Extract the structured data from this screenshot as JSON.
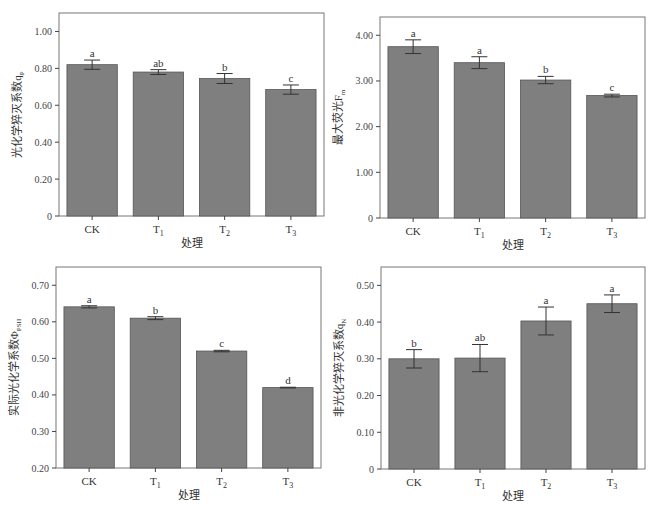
{
  "figure": {
    "caption": "",
    "bar_color": "#7f7f7f",
    "bar_edge": "#555555",
    "frame_color": "#777777"
  },
  "chart_data": [
    {
      "type": "bar",
      "title": "",
      "xlabel": "处理",
      "ylabel": "光化学猝灭系数qP",
      "ylabel_main": "光化学猝灭系数q",
      "ylabel_sub": "P",
      "categories": [
        "CK",
        "T1",
        "T2",
        "T3"
      ],
      "category_labels": [
        {
          "main": "CK",
          "sub": ""
        },
        {
          "main": "T",
          "sub": "1"
        },
        {
          "main": "T",
          "sub": "2"
        },
        {
          "main": "T",
          "sub": "3"
        }
      ],
      "values": [
        0.82,
        0.78,
        0.745,
        0.685
      ],
      "errors": [
        0.025,
        0.013,
        0.027,
        0.025
      ],
      "significance": [
        "a",
        "ab",
        "b",
        "c"
      ],
      "yticks": [
        0,
        0.2,
        0.4,
        0.6,
        0.8,
        1.0
      ],
      "ytick_labels": [
        "0",
        "0.20",
        "0.40",
        "0.60",
        "0.80",
        "1.00"
      ],
      "ylim": [
        0,
        1.1
      ],
      "grid": false,
      "legend": null
    },
    {
      "type": "bar",
      "title": "",
      "xlabel": "处理",
      "ylabel": "最大荧光Fm",
      "ylabel_main": "最大荧光F",
      "ylabel_sub": "m",
      "categories": [
        "CK",
        "T1",
        "T2",
        "T3"
      ],
      "category_labels": [
        {
          "main": "CK",
          "sub": ""
        },
        {
          "main": "T",
          "sub": "1"
        },
        {
          "main": "T",
          "sub": "2"
        },
        {
          "main": "T",
          "sub": "3"
        }
      ],
      "values": [
        3.75,
        3.4,
        3.02,
        2.68
      ],
      "errors": [
        0.15,
        0.13,
        0.08,
        0.03
      ],
      "significance": [
        "a",
        "a",
        "b",
        "c"
      ],
      "yticks": [
        0,
        1,
        2,
        3,
        4
      ],
      "ytick_labels": [
        "0",
        "1.00",
        "2.00",
        "3.00",
        "4.00"
      ],
      "ylim": [
        0,
        4.4
      ],
      "grid": false,
      "legend": null
    },
    {
      "type": "bar",
      "title": "",
      "xlabel": "处理",
      "ylabel": "实际光化学系数ΦPSII",
      "ylabel_main": "实际光化学系数Φ",
      "ylabel_sub": "PSII",
      "categories": [
        "CK",
        "T1",
        "T2",
        "T3"
      ],
      "category_labels": [
        {
          "main": "CK",
          "sub": ""
        },
        {
          "main": "T",
          "sub": "1"
        },
        {
          "main": "T",
          "sub": "2"
        },
        {
          "main": "T",
          "sub": "3"
        }
      ],
      "values": [
        0.641,
        0.61,
        0.52,
        0.42
      ],
      "errors": [
        0.003,
        0.004,
        0.002,
        0.001
      ],
      "significance": [
        "a",
        "b",
        "c",
        "d"
      ],
      "yticks": [
        0.2,
        0.3,
        0.4,
        0.5,
        0.6,
        0.7
      ],
      "ytick_labels": [
        "0.20",
        "0.30",
        "0.40",
        "0.50",
        "0.60",
        "0.70"
      ],
      "ylim": [
        0.2,
        0.75
      ],
      "grid": false,
      "legend": null
    },
    {
      "type": "bar",
      "title": "",
      "xlabel": "处理",
      "ylabel": "非光化学猝灭系数qN",
      "ylabel_main": "非光化学猝灭系数q",
      "ylabel_sub": "N",
      "categories": [
        "CK",
        "T1",
        "T2",
        "T3"
      ],
      "category_labels": [
        {
          "main": "CK",
          "sub": ""
        },
        {
          "main": "T",
          "sub": "1"
        },
        {
          "main": "T",
          "sub": "2"
        },
        {
          "main": "T",
          "sub": "3"
        }
      ],
      "values": [
        0.3,
        0.302,
        0.403,
        0.45
      ],
      "errors": [
        0.025,
        0.037,
        0.038,
        0.024
      ],
      "significance": [
        "b",
        "ab",
        "a",
        "a"
      ],
      "yticks": [
        0,
        0.1,
        0.2,
        0.3,
        0.4,
        0.5
      ],
      "ytick_labels": [
        "0",
        "0.10",
        "0.20",
        "0.30",
        "0.40",
        "0.50"
      ],
      "ylim": [
        0,
        0.55
      ],
      "grid": false,
      "legend": null
    }
  ]
}
